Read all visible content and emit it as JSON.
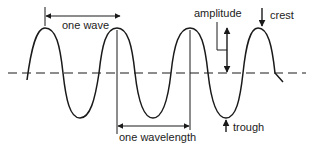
{
  "diagram": {
    "colors": {
      "line": "#1a1a1a",
      "text": "#222222",
      "background": "#ffffff"
    },
    "labels": {
      "one_wave": "one wave",
      "amplitude": "amplitude",
      "crest": "crest",
      "one_wavelength": "one wavelength",
      "trough": "trough"
    },
    "axis": {
      "style": "dashed",
      "y": 73
    }
  }
}
